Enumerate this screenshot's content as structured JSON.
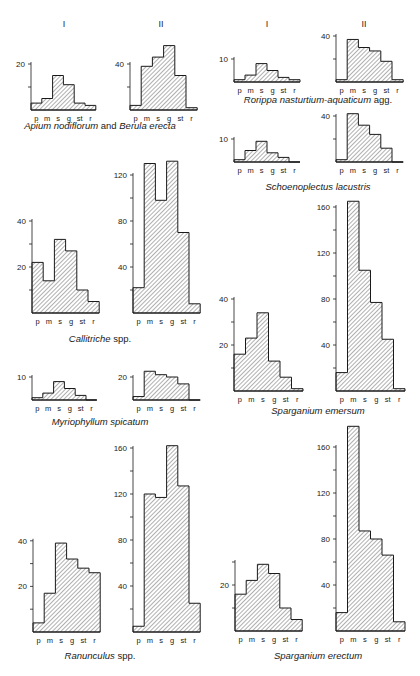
{
  "figure": {
    "column_headers": [
      {
        "label": "I",
        "x": 64,
        "y": 27
      },
      {
        "label": "II",
        "x": 161,
        "y": 27
      },
      {
        "label": "I",
        "x": 267,
        "y": 27
      },
      {
        "label": "II",
        "x": 364,
        "y": 27
      }
    ],
    "categories": [
      "p",
      "m",
      "s",
      "g",
      "st",
      "r"
    ]
  },
  "chart_data": [
    {
      "type": "bar",
      "species": "Apium nodiflorum and Berula erecta",
      "caption_parts": [
        {
          "text": "Apium nodiflorum",
          "italic": true
        },
        {
          "text": " and ",
          "italic": false
        },
        {
          "text": "Berula erecta",
          "italic": true
        }
      ],
      "caption_pos": [
        100,
        129
      ],
      "categories": [
        "p",
        "m",
        "s",
        "g",
        "st",
        "r"
      ],
      "category_labels_variant": [
        "p|m",
        "",
        "s",
        "g",
        "st",
        "r"
      ],
      "panels": [
        {
          "name": "I",
          "values": [
            3,
            5,
            15,
            11,
            3,
            2
          ],
          "yticks": [
            10,
            20
          ],
          "tick_labels": {
            "20": "20"
          },
          "axis_x": 31,
          "baseline": 110,
          "px_per_unit": 2.3,
          "bar_w": 10.8
        },
        {
          "name": "II",
          "values": [
            4,
            38,
            46,
            56,
            30,
            2
          ],
          "yticks": [
            20,
            40
          ],
          "tick_labels": {
            "40": "40"
          },
          "axis_x": 130,
          "baseline": 110,
          "px_per_unit": 1.15,
          "bar_w": 11.2
        }
      ]
    },
    {
      "type": "bar",
      "species": "Callitriche spp.",
      "caption_parts": [
        {
          "text": "Callitriche",
          "italic": true
        },
        {
          "text": " spp.",
          "italic": false
        }
      ],
      "caption_pos": [
        100,
        342
      ],
      "categories": [
        "p",
        "m",
        "s",
        "g",
        "st",
        "r"
      ],
      "panels": [
        {
          "name": "I",
          "values": [
            22,
            14,
            32,
            27,
            10,
            5
          ],
          "yticks": [
            10,
            20,
            30,
            40
          ],
          "tick_labels": {
            "20": "20",
            "40": "40"
          },
          "axis_x": 32,
          "baseline": 313,
          "px_per_unit": 2.3,
          "bar_w": 11.2
        },
        {
          "name": "II",
          "values": [
            22,
            130,
            98,
            132,
            70,
            8
          ],
          "yticks": [
            20,
            40,
            60,
            80,
            100,
            120
          ],
          "tick_labels": {
            "40": "40",
            "80": "80",
            "120": "120"
          },
          "axis_x": 133,
          "baseline": 313,
          "px_per_unit": 1.15,
          "bar_w": 11.2
        }
      ]
    },
    {
      "type": "bar",
      "species": "Myriophyllum spicatum",
      "caption_parts": [
        {
          "text": "Myriophyllum spicatum",
          "italic": true
        }
      ],
      "caption_pos": [
        100,
        425
      ],
      "categories": [
        "p",
        "m",
        "s",
        "g",
        "st",
        "r"
      ],
      "category_labels_variant": [
        "p|m",
        "",
        "s",
        "g",
        "st",
        "r"
      ],
      "panels": [
        {
          "name": "I",
          "values": [
            1,
            3,
            8,
            5,
            2,
            0
          ],
          "yticks": [
            10
          ],
          "tick_labels": {
            "10": "10"
          },
          "axis_x": 32,
          "baseline": 400,
          "px_per_unit": 2.3,
          "bar_w": 10.8
        },
        {
          "name": "II",
          "values": [
            3,
            25,
            22,
            20,
            14,
            0
          ],
          "yticks": [
            20
          ],
          "tick_labels": {
            "20": "20"
          },
          "axis_x": 133,
          "baseline": 400,
          "px_per_unit": 1.15,
          "bar_w": 11.2
        }
      ]
    },
    {
      "type": "bar",
      "species": "Ranunculus spp.",
      "caption_parts": [
        {
          "text": "Ranunculus",
          "italic": true
        },
        {
          "text": " spp.",
          "italic": false
        }
      ],
      "caption_pos": [
        100,
        659
      ],
      "categories": [
        "p",
        "m",
        "s",
        "g",
        "st",
        "r"
      ],
      "panels": [
        {
          "name": "I",
          "values": [
            4,
            17,
            39,
            32,
            28,
            26
          ],
          "yticks": [
            10,
            20,
            30,
            40
          ],
          "tick_labels": {
            "20": "20",
            "40": "40"
          },
          "axis_x": 33,
          "baseline": 632,
          "px_per_unit": 2.28,
          "bar_w": 11.2
        },
        {
          "name": "II",
          "values": [
            5,
            120,
            117,
            162,
            127,
            25
          ],
          "yticks": [
            20,
            40,
            60,
            80,
            100,
            120,
            140,
            160
          ],
          "tick_labels": {
            "40": "40",
            "80": "80",
            "120": "120",
            "160": "160"
          },
          "axis_x": 133,
          "baseline": 632,
          "px_per_unit": 1.15,
          "bar_w": 11.2
        }
      ]
    },
    {
      "type": "bar",
      "species": "Rorippa nasturtium-aquaticum agg.",
      "caption_parts": [
        {
          "text": "Rorippa nasturtium-aquaticum",
          "italic": true
        },
        {
          "text": " agg.",
          "italic": false
        }
      ],
      "caption_pos": [
        318,
        103
      ],
      "categories": [
        "p",
        "m",
        "s",
        "g",
        "st",
        "r"
      ],
      "panels": [
        {
          "name": "I",
          "values": [
            1,
            3,
            8,
            5,
            2,
            1
          ],
          "yticks": [
            10
          ],
          "tick_labels": {
            "10": "10"
          },
          "axis_x": 234,
          "baseline": 82,
          "px_per_unit": 2.3,
          "bar_w": 11.0
        },
        {
          "name": "II",
          "values": [
            2,
            37,
            30,
            27,
            18,
            2
          ],
          "yticks": [
            20,
            40
          ],
          "tick_labels": {
            "40": "40"
          },
          "axis_x": 336,
          "baseline": 82,
          "px_per_unit": 1.15,
          "bar_w": 11.2
        }
      ]
    },
    {
      "type": "bar",
      "species": "Schoenoplectus lacustris",
      "caption_parts": [
        {
          "text": "Schoenoplectus lacustris",
          "italic": true
        }
      ],
      "caption_pos": [
        318,
        190
      ],
      "categories": [
        "p",
        "m",
        "s",
        "g",
        "st",
        "r"
      ],
      "panels": [
        {
          "name": "I",
          "values": [
            1,
            5,
            9,
            4,
            2,
            0
          ],
          "yticks": [
            10
          ],
          "tick_labels": {
            "10": "10"
          },
          "axis_x": 234,
          "baseline": 162,
          "px_per_unit": 2.3,
          "bar_w": 11.0
        },
        {
          "name": "II",
          "values": [
            2,
            42,
            32,
            24,
            12,
            0
          ],
          "yticks": [
            20,
            40
          ],
          "tick_labels": {
            "40": "40"
          },
          "axis_x": 336,
          "baseline": 162,
          "px_per_unit": 1.15,
          "bar_w": 11.2
        }
      ]
    },
    {
      "type": "bar",
      "species": "Sparganium emersum",
      "caption_parts": [
        {
          "text": "Sparganium emersum",
          "italic": true
        }
      ],
      "caption_pos": [
        318,
        414
      ],
      "categories": [
        "p",
        "m",
        "s",
        "g",
        "st",
        "r"
      ],
      "panels": [
        {
          "name": "I",
          "values": [
            16,
            23,
            34,
            13,
            6,
            1
          ],
          "yticks": [
            10,
            20,
            30,
            40
          ],
          "tick_labels": {
            "20": "20",
            "40": "40"
          },
          "axis_x": 234,
          "baseline": 391,
          "px_per_unit": 2.3,
          "bar_w": 11.5
        },
        {
          "name": "II",
          "values": [
            16,
            165,
            105,
            77,
            45,
            2
          ],
          "yticks": [
            20,
            40,
            60,
            80,
            100,
            120,
            140,
            160
          ],
          "tick_labels": {
            "40": "40",
            "80": "80",
            "120": "120",
            "160": "160"
          },
          "axis_x": 336,
          "baseline": 391,
          "px_per_unit": 1.15,
          "bar_w": 11.5
        }
      ]
    },
    {
      "type": "bar",
      "species": "Sparganium erectum",
      "caption_parts": [
        {
          "text": "Sparganium erectum",
          "italic": true
        }
      ],
      "caption_pos": [
        318,
        659
      ],
      "categories": [
        "p",
        "m",
        "s",
        "g",
        "st",
        "r"
      ],
      "panels": [
        {
          "name": "I",
          "values": [
            16,
            22,
            29,
            25,
            10,
            5
          ],
          "yticks": [
            10,
            20,
            30
          ],
          "tick_labels": {
            "20": "20"
          },
          "axis_x": 235,
          "baseline": 631,
          "px_per_unit": 2.3,
          "bar_w": 11.2
        },
        {
          "name": "II",
          "values": [
            16,
            178,
            87,
            80,
            66,
            8
          ],
          "yticks": [
            20,
            40,
            60,
            80,
            100,
            120,
            140,
            160
          ],
          "tick_labels": {
            "40": "40",
            "80": "80",
            "120": "120",
            "160": "160"
          },
          "axis_x": 336,
          "baseline": 631,
          "px_per_unit": 1.15,
          "bar_w": 11.5
        }
      ]
    }
  ]
}
